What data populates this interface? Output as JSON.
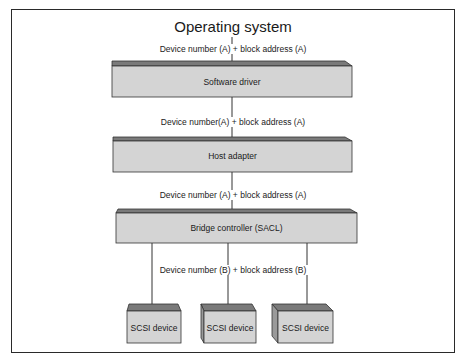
{
  "diagram": {
    "title": "Operating system",
    "layers": [
      {
        "id": "software-driver",
        "label": "Software driver"
      },
      {
        "id": "host-adapter",
        "label": "Host adapter"
      },
      {
        "id": "bridge-controller",
        "label": "Bridge controller (SACL)"
      }
    ],
    "connections": [
      {
        "from": "operating-system",
        "to": "software-driver",
        "label": "Device number (A) + block address (A)"
      },
      {
        "from": "software-driver",
        "to": "host-adapter",
        "label": "Device number(A) + block address (A)"
      },
      {
        "from": "host-adapter",
        "to": "bridge-controller",
        "label": "Device number (A) + block address (A)"
      },
      {
        "from": "bridge-controller",
        "to": "scsi-devices",
        "label": "Device number (B) + block address (B)"
      }
    ],
    "devices": [
      {
        "label": "SCSI device"
      },
      {
        "label": "SCSI device"
      },
      {
        "label": "SCSI device"
      }
    ],
    "colors": {
      "box_face": "#d4d4d4",
      "box_top": "#7a7a7a",
      "box_side": "#9a9a9a",
      "line": "#333333",
      "frame": "#2a2a2a"
    }
  }
}
